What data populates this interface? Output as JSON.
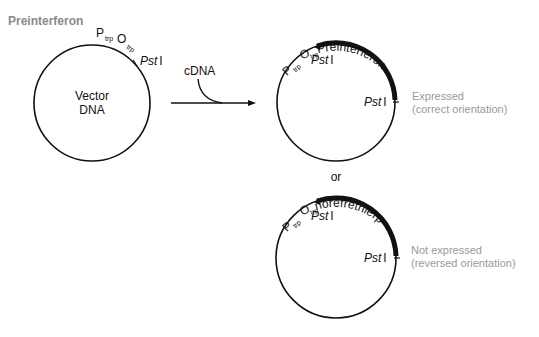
{
  "title": "Preinterferon",
  "vector": {
    "label_line1": "Vector",
    "label_line2": "DNA",
    "promoter": "P",
    "promoter_sub": "trp",
    "operator": "O",
    "operator_sub": "trp",
    "site": "Pst",
    "site_numeral": "I"
  },
  "arrow": {
    "insert_label": "cDNA"
  },
  "plasmid_correct": {
    "gene_label": "Preinterferon",
    "promoter": "P",
    "promoter_sub": "trp",
    "operator": "O",
    "operator_sub": "trp",
    "site1": "Pst",
    "site1_numeral": "I",
    "site2": "Pst",
    "site2_numeral": "I",
    "outcome_line1": "Expressed",
    "outcome_line2": "(correct orientation)"
  },
  "separator": "or",
  "plasmid_reversed": {
    "gene_label": "norefretnierp",
    "promoter": "P",
    "promoter_sub": "trp",
    "operator": "O",
    "operator_sub": "trp",
    "site1": "Pst",
    "site1_numeral": "I",
    "site2": "Pst",
    "site2_numeral": "I",
    "outcome_line1": "Not expressed",
    "outcome_line2": "(reversed orientation)"
  }
}
